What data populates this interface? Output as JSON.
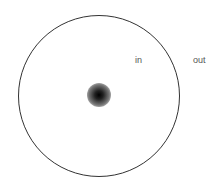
{
  "diagram": {
    "labels": {
      "inside": "in",
      "outside": "out"
    },
    "elements": [
      {
        "type": "circle-boundary",
        "description": "large circle outline"
      },
      {
        "type": "point",
        "description": "blurred dark dot at circle center"
      }
    ]
  }
}
